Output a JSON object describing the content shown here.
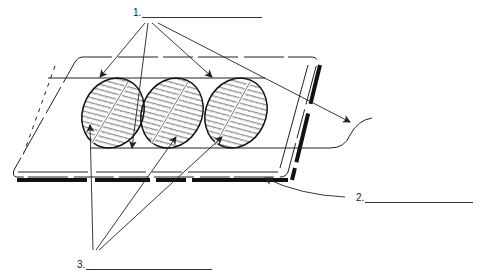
{
  "diagram": {
    "labels": [
      {
        "id": "1",
        "text": "1.",
        "blank": ""
      },
      {
        "id": "2",
        "text": "2.",
        "blank": ""
      },
      {
        "id": "3",
        "text": "3.",
        "blank": ""
      }
    ],
    "parts": {
      "slide": "glass slide",
      "smears": [
        "smear-1",
        "smear-2",
        "smear-3"
      ],
      "string": "string/thread"
    },
    "colors": {
      "ink": "#222222",
      "background": "#ffffff"
    }
  }
}
